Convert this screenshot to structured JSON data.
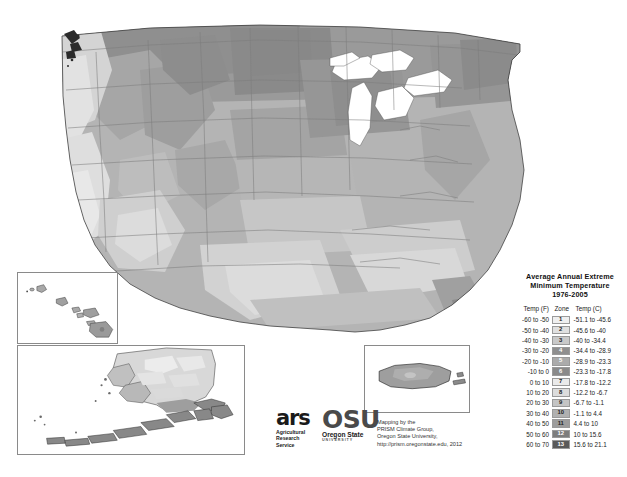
{
  "legend": {
    "title_lines": [
      "Average Annual Extreme",
      "Minimum Temperature",
      "1976-2005"
    ],
    "headers": {
      "fahrenheit": "Temp (F)",
      "zone": "Zone",
      "celsius": "Temp (C)"
    },
    "rows": [
      {
        "f": "-60 to -50",
        "zone": "1",
        "c": "-51.1 to -45.6",
        "swatch": "#efefef",
        "text": "#222222"
      },
      {
        "f": "-50 to -40",
        "zone": "2",
        "c": "-45.6 to -40",
        "swatch": "#e0e0e0",
        "text": "#222222"
      },
      {
        "f": "-40 to -30",
        "zone": "3",
        "c": "-40 to -34.4",
        "swatch": "#c9c9c9",
        "text": "#222222"
      },
      {
        "f": "-30 to -20",
        "zone": "4",
        "c": "-34.4 to -28.9",
        "swatch": "#8f8f8f",
        "text": "#ffffff"
      },
      {
        "f": "-20 to -10",
        "zone": "5",
        "c": "-28.9 to -23.3",
        "swatch": "#ababab",
        "text": "#ffffff"
      },
      {
        "f": "-10 to 0",
        "zone": "6",
        "c": "-23.3 to -17.8",
        "swatch": "#8a8a8a",
        "text": "#ffffff"
      },
      {
        "f": "0 to 10",
        "zone": "7",
        "c": "-17.8 to -12.2",
        "swatch": "#eaeaea",
        "text": "#222222"
      },
      {
        "f": "10 to 20",
        "zone": "8",
        "c": "-12.2 to -6.7",
        "swatch": "#dcdcdc",
        "text": "#222222"
      },
      {
        "f": "20 to 30",
        "zone": "9",
        "c": "-6.7 to -1.1",
        "swatch": "#c4c4c4",
        "text": "#222222"
      },
      {
        "f": "30 to 40",
        "zone": "10",
        "c": "-1.1 to 4.4",
        "swatch": "#b0b0b0",
        "text": "#222222"
      },
      {
        "f": "40 to 50",
        "zone": "11",
        "c": "4.4 to 10",
        "swatch": "#9c9c9c",
        "text": "#222222"
      },
      {
        "f": "50 to 60",
        "zone": "12",
        "c": "10 to 15.6",
        "swatch": "#7d7d7d",
        "text": "#ffffff"
      },
      {
        "f": "60 to 70",
        "zone": "13",
        "c": "15.6 to 21.1",
        "swatch": "#5a5a5a",
        "text": "#ffffff"
      }
    ]
  },
  "credits": {
    "ars": {
      "mark": "ars",
      "lines": [
        "Agricultural",
        "Research",
        "Service"
      ]
    },
    "osu": {
      "mark": "OSU",
      "name": "Oregon State",
      "sub": "UNIVERSITY"
    },
    "mapping": [
      "Mapping by the",
      "PRISM Climate Group,",
      "Oregon State University,",
      "http://prism.oregonstate.edu, 2012"
    ]
  },
  "map": {
    "conus_label": "contiguous-united-states",
    "insets": [
      {
        "name": "hawaii"
      },
      {
        "name": "alaska"
      },
      {
        "name": "puerto-rico"
      }
    ]
  }
}
